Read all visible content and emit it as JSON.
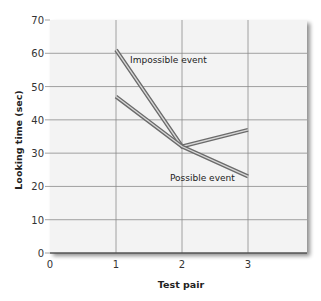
{
  "chart_data": {
    "type": "line",
    "title": "",
    "xlabel": "Test pair",
    "ylabel": "Looking time (sec)",
    "x": [
      1,
      2,
      3
    ],
    "x_ticks": [
      "0",
      "1",
      "2",
      "3"
    ],
    "y_ticks": [
      "0",
      "10",
      "20",
      "30",
      "40",
      "50",
      "60",
      "70"
    ],
    "xlim": [
      0,
      3.9
    ],
    "ylim": [
      0,
      70
    ],
    "grid": true,
    "legend": "inline labels",
    "series": [
      {
        "name": "Impossible event",
        "values": [
          61,
          32,
          37
        ]
      },
      {
        "name": "Possible event",
        "values": [
          47,
          32,
          23
        ]
      }
    ]
  },
  "colors": {
    "plot_background": "#f3f3f3",
    "grid": "#8a8a8a",
    "line_outer": "#6b6b6b",
    "line_inner": "#d8d8d8"
  }
}
